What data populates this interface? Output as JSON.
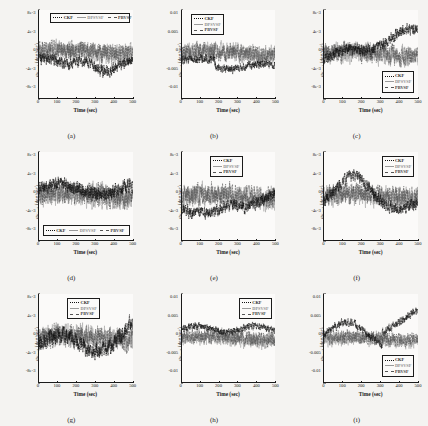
{
  "figure": {
    "type": "multi-panel-line-chart",
    "rows": 3,
    "cols": 3,
    "series_names": [
      "CKF",
      "DPSVSF",
      "PBVSF"
    ],
    "colors": {
      "ckf": "#111111",
      "dpsvsf": "#9a9a9a",
      "pbvsf": "#555555"
    }
  },
  "axis": {
    "xlabel": "Time (sec)",
    "xticks": [
      "0",
      "100",
      "200",
      "300",
      "400",
      "500"
    ],
    "xlim": [
      0,
      500
    ]
  },
  "chart_data": [
    {
      "id": "a",
      "caption": "(a)",
      "type": "line",
      "title": "",
      "xlabel": "Time (sec)",
      "ylabel": "ω (deg/sec)",
      "ylabel_sub": "Errx1",
      "xlim": [
        0,
        500
      ],
      "ylim": [
        -0.008,
        0.008
      ],
      "yticks": [
        "8e-3",
        "4e-3",
        "0",
        "-4e-3",
        "-8e-3"
      ],
      "ytickvals": [
        0.008,
        0.004,
        0,
        -0.004,
        -0.008
      ],
      "grid": false,
      "legend_position": "top-horizontal",
      "series": [
        {
          "name": "CKF",
          "mean_level": -0.0022,
          "noise": 0.0013,
          "drift": "settles negative after 150 s"
        },
        {
          "name": "DPSVSF",
          "mean_level": 0.0002,
          "noise": 0.0022,
          "drift": "zero-centred, wide spread"
        },
        {
          "name": "PBVSF",
          "mean_level": 0.0004,
          "noise": 0.002,
          "drift": "zero-centred, oscillatory"
        }
      ]
    },
    {
      "id": "b",
      "caption": "(b)",
      "type": "line",
      "title": "",
      "xlabel": "Time (sec)",
      "ylabel": "ω (deg/sec)",
      "ylabel_sub": "Erry1",
      "xlim": [
        0,
        500
      ],
      "ylim": [
        -0.01,
        0.01
      ],
      "yticks": [
        "0.01",
        "0.005",
        "0",
        "-0.005",
        "-0.01"
      ],
      "ytickvals": [
        0.01,
        0.005,
        0,
        -0.005,
        -0.01
      ],
      "grid": false,
      "legend_position": "top-left-vertical",
      "series": [
        {
          "name": "CKF",
          "mean_level": -0.0028,
          "noise": 0.0012,
          "drift": "negative bias after 220 s"
        },
        {
          "name": "DPSVSF",
          "mean_level": 0.0003,
          "noise": 0.0026,
          "drift": "large swings after 230 s"
        },
        {
          "name": "PBVSF",
          "mean_level": 0.0002,
          "noise": 0.0024,
          "drift": "large swings after 230 s"
        }
      ]
    },
    {
      "id": "c",
      "caption": "(c)",
      "type": "line",
      "title": "",
      "xlabel": "Time (sec)",
      "ylabel": "ω (deg/sec)",
      "ylabel_sub": "Errz1",
      "xlim": [
        0,
        500
      ],
      "ylim": [
        -0.008,
        0.008
      ],
      "yticks": [
        "8e-3",
        "4e-3",
        "0",
        "-4e-3",
        "-8e-3"
      ],
      "ytickvals": [
        0.008,
        0.004,
        0,
        -0.004,
        -0.008
      ],
      "grid": false,
      "legend_position": "bottom-right-vertical",
      "series": [
        {
          "name": "CKF",
          "mean_level": 0.0026,
          "noise": 0.0012,
          "drift": "rises steadily toward +5e-3"
        },
        {
          "name": "DPSVSF",
          "mean_level": 0.0,
          "noise": 0.0022,
          "drift": "zero-centred"
        },
        {
          "name": "PBVSF",
          "mean_level": 0.0001,
          "noise": 0.0021,
          "drift": "zero-centred"
        }
      ]
    },
    {
      "id": "d",
      "caption": "(d)",
      "type": "line",
      "title": "",
      "xlabel": "Time (sec)",
      "ylabel": "ω (deg/sec)",
      "ylabel_sub": "Errx2",
      "xlim": [
        0,
        500
      ],
      "ylim": [
        -0.008,
        0.008
      ],
      "yticks": [
        "8e-3",
        "4e-3",
        "0",
        "-4e-3",
        "-8e-3"
      ],
      "ytickvals": [
        0.008,
        0.004,
        0,
        -0.004,
        -0.008
      ],
      "grid": false,
      "legend_position": "bottom-horizontal",
      "series": [
        {
          "name": "CKF",
          "mean_level": 0.0012,
          "noise": 0.0015,
          "drift": "mildly positive"
        },
        {
          "name": "DPSVSF",
          "mean_level": 0.0,
          "noise": 0.0026,
          "drift": "zero-centred"
        },
        {
          "name": "PBVSF",
          "mean_level": 0.0002,
          "noise": 0.0024,
          "drift": "zero-centred"
        }
      ]
    },
    {
      "id": "e",
      "caption": "(e)",
      "type": "line",
      "title": "",
      "xlabel": "Time (sec)",
      "ylabel": "ω (deg/sec)",
      "ylabel_sub": "Erry2",
      "xlim": [
        0,
        500
      ],
      "ylim": [
        -0.008,
        0.008
      ],
      "yticks": [
        "8e-3",
        "4e-3",
        "0",
        "-4e-3",
        "-8e-3"
      ],
      "ytickvals": [
        0.008,
        0.004,
        0,
        -0.004,
        -0.008
      ],
      "grid": false,
      "legend_position": "top-center-vertical",
      "series": [
        {
          "name": "CKF",
          "mean_level": -0.0024,
          "noise": 0.0013,
          "drift": "negative until 330 s then recovers"
        },
        {
          "name": "DPSVSF",
          "mean_level": -0.0002,
          "noise": 0.0024,
          "drift": "zero-centred"
        },
        {
          "name": "PBVSF",
          "mean_level": 0.0,
          "noise": 0.0023,
          "drift": "zero-centred"
        }
      ]
    },
    {
      "id": "f",
      "caption": "(f)",
      "type": "line",
      "title": "",
      "xlabel": "Time (sec)",
      "ylabel": "ω (deg/sec)",
      "ylabel_sub": "Errz2",
      "xlim": [
        0,
        500
      ],
      "ylim": [
        -0.008,
        0.008
      ],
      "yticks": [
        "8e-3",
        "4e-3",
        "0",
        "-4e-3",
        "-8e-3"
      ],
      "ytickvals": [
        0.008,
        0.004,
        0,
        -0.004,
        -0.008
      ],
      "grid": false,
      "legend_position": "top-right-vertical",
      "series": [
        {
          "name": "CKF",
          "mean_level": 0.0018,
          "noise": 0.0013,
          "drift": "hump peaking near 170 s"
        },
        {
          "name": "DPSVSF",
          "mean_level": -0.0001,
          "noise": 0.0023,
          "drift": "zero-centred"
        },
        {
          "name": "PBVSF",
          "mean_level": 0.0,
          "noise": 0.0022,
          "drift": "zero-centred"
        }
      ]
    },
    {
      "id": "g",
      "caption": "(g)",
      "type": "line",
      "title": "",
      "xlabel": "Time (sec)",
      "ylabel": "ω (deg/sec)",
      "ylabel_sub": "Errx3",
      "xlim": [
        0,
        500
      ],
      "ylim": [
        -0.008,
        0.008
      ],
      "yticks": [
        "8e-3",
        "4e-3",
        "0",
        "-4e-3",
        "-8e-3"
      ],
      "ytickvals": [
        0.008,
        0.004,
        0,
        -0.004,
        -0.008
      ],
      "grid": false,
      "legend_position": "top-center-vertical",
      "series": [
        {
          "name": "CKF",
          "mean_level": 0.0006,
          "noise": 0.0018,
          "drift": "slow wander, dips near 300 s"
        },
        {
          "name": "DPSVSF",
          "mean_level": 0.0,
          "noise": 0.0025,
          "drift": "zero-centred"
        },
        {
          "name": "PBVSF",
          "mean_level": 0.0001,
          "noise": 0.0024,
          "drift": "zero-centred"
        }
      ]
    },
    {
      "id": "h",
      "caption": "(h)",
      "type": "line",
      "title": "",
      "xlabel": "Time (sec)",
      "ylabel": "ω (deg/sec)",
      "ylabel_sub": "Erry3",
      "xlim": [
        0,
        500
      ],
      "ylim": [
        -0.01,
        0.01
      ],
      "yticks": [
        "0.01",
        "0.005",
        "0",
        "-0.005",
        "-0.01"
      ],
      "ytickvals": [
        0.01,
        0.005,
        0,
        -0.005,
        -0.01
      ],
      "grid": false,
      "legend_position": "top-right-vertical",
      "series": [
        {
          "name": "CKF",
          "mean_level": 0.002,
          "noise": 0.001,
          "drift": "steady positive band"
        },
        {
          "name": "DPSVSF",
          "mean_level": -0.0002,
          "noise": 0.0022,
          "drift": "zero-centred"
        },
        {
          "name": "PBVSF",
          "mean_level": 0.0,
          "noise": 0.002,
          "drift": "zero-centred"
        }
      ]
    },
    {
      "id": "i",
      "caption": "(i)",
      "type": "line",
      "title": "",
      "xlabel": "Time (sec)",
      "ylabel": "ω (deg/sec)",
      "ylabel_sub": "Errz3",
      "xlim": [
        0,
        500
      ],
      "ylim": [
        -0.01,
        0.01
      ],
      "yticks": [
        "0.01",
        "0.005",
        "0",
        "-0.005",
        "-0.01"
      ],
      "ytickvals": [
        0.01,
        0.005,
        0,
        -0.005,
        -0.01
      ],
      "grid": false,
      "legend_position": "bottom-right-vertical",
      "series": [
        {
          "name": "CKF",
          "mean_level": 0.003,
          "noise": 0.0011,
          "drift": "climbs to +6e-3 after 330 s"
        },
        {
          "name": "DPSVSF",
          "mean_level": -0.0003,
          "noise": 0.002,
          "drift": "zero-centred"
        },
        {
          "name": "PBVSF",
          "mean_level": -0.0001,
          "noise": 0.0019,
          "drift": "zero-centred"
        }
      ]
    }
  ]
}
